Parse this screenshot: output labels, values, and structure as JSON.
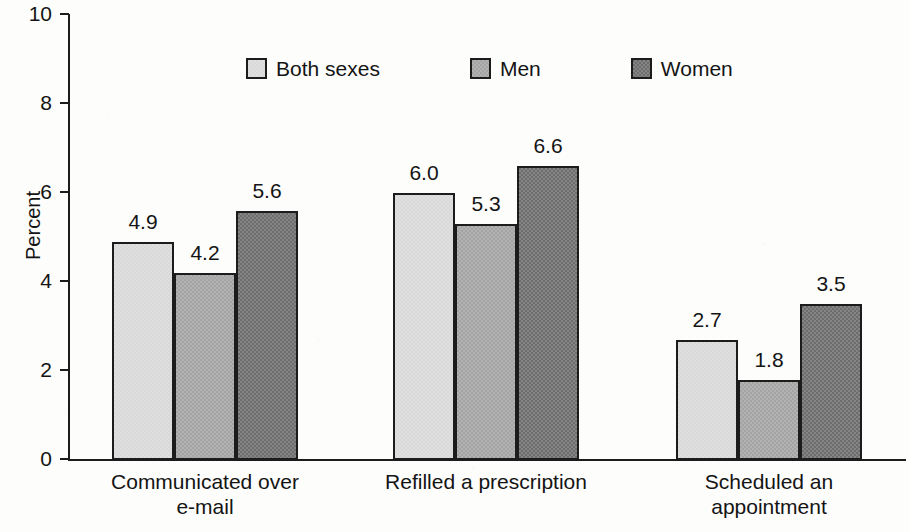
{
  "chart_data": {
    "type": "bar",
    "title": "",
    "xlabel": "",
    "ylabel": "Percent",
    "ylim": [
      0,
      10
    ],
    "yticks": [
      0,
      2,
      4,
      6,
      8,
      10
    ],
    "ytick_labels": [
      "0",
      "2",
      "4",
      "6",
      "8",
      "10"
    ],
    "grid": false,
    "legend_position": "top-center",
    "categories": [
      "Communicated over e-mail",
      "Refilled a prescription",
      "Scheduled an appointment"
    ],
    "category_lines": [
      [
        "Communicated over",
        "e-mail"
      ],
      [
        "Refilled a prescription"
      ],
      [
        "Scheduled an",
        "appointment"
      ]
    ],
    "series": [
      {
        "name": "Both sexes",
        "color": "#d9d9d9",
        "values": [
          4.9,
          6.0,
          2.7
        ]
      },
      {
        "name": "Men",
        "color": "#a3a3a3",
        "values": [
          4.2,
          5.3,
          1.8
        ]
      },
      {
        "name": "Women",
        "color": "#6d6d6d",
        "values": [
          5.6,
          6.6,
          3.5
        ]
      }
    ],
    "value_labels": [
      [
        "4.9",
        "4.2",
        "5.6"
      ],
      [
        "6.0",
        "5.3",
        "6.6"
      ],
      [
        "2.7",
        "1.8",
        "3.5"
      ]
    ]
  },
  "axis": {
    "y_title": "Percent"
  },
  "legend": {
    "items": [
      {
        "label": "Both sexes"
      },
      {
        "label": "Men"
      },
      {
        "label": "Women"
      }
    ]
  }
}
